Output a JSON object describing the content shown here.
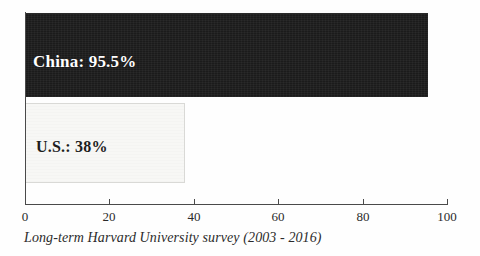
{
  "chart_data": {
    "type": "bar",
    "orientation": "horizontal",
    "title": "",
    "subtitle": "",
    "xlabel": "",
    "ylabel": "",
    "categories": [
      "China",
      "U.S."
    ],
    "values": [
      95.5,
      38
    ],
    "series": [
      {
        "name": "Approval",
        "values": [
          95.5,
          38
        ]
      }
    ],
    "bars": [
      {
        "category": "China",
        "value": 95.5,
        "label": "China: 95.5%",
        "fill": "#1b1b1b",
        "text_color": "#ffffff"
      },
      {
        "category": "U.S.",
        "value": 38,
        "label": "U.S.: 38%",
        "fill": "#f7f7f5",
        "text_color": "#1d1d1d"
      }
    ],
    "xlim": [
      0,
      100
    ],
    "ylim": [
      0,
      2
    ],
    "xticks": [
      0,
      20,
      40,
      60,
      80,
      100
    ],
    "xtick_labels": [
      "0",
      "20",
      "40",
      "60",
      "80",
      "100"
    ],
    "grid": false,
    "legend": false,
    "legend_position": "none",
    "annotations": [
      "Long-term Harvard University survey (2003 - 2016)"
    ],
    "caption": "Long-term Harvard University survey (2003 - 2016)"
  },
  "colors": {
    "background": "#fefefe",
    "axis": "#4a4a4a",
    "china_bar": "#1b1b1b",
    "us_bar": "#f7f7f5",
    "us_bar_border": "#d9d9d6",
    "tick_text": "#2a2a2a",
    "caption_text": "#2b2b2b"
  }
}
